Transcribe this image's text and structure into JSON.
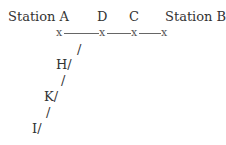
{
  "diagram": {
    "labels": {
      "station_a": "Station A",
      "d": "D",
      "c": "C",
      "station_b": "Station B.",
      "h": "H/",
      "k": "K/",
      "i": "I/"
    },
    "markers": {
      "x": "x",
      "slash": "/"
    }
  }
}
